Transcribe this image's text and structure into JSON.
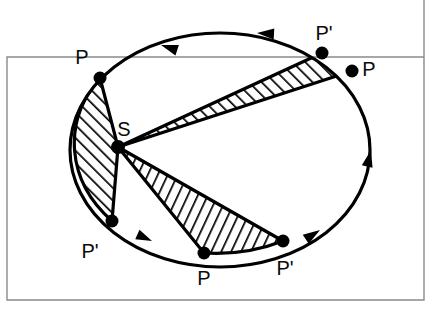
{
  "figure": {
    "kind": "keplers-second-law-diagram",
    "stroke_color": "#000000",
    "frame_color": "#8a8a8a",
    "background_color": "#ffffff",
    "hatch_color": "#000000"
  },
  "frame": {
    "left_x": 7,
    "top_y": 57,
    "right_x": 424,
    "bottom_y": 300,
    "stroke_width": 1.4
  },
  "orbit": {
    "center": {
      "x": 220,
      "y": 150
    },
    "radius_x": 150,
    "radius_y": 117,
    "stroke_width": 3.2,
    "direction": "counterclockwise"
  },
  "focus": {
    "label": "S",
    "x": 118,
    "y": 147,
    "dot_radius": 6,
    "label_x": 124,
    "label_y": 136
  },
  "orbit_points": [
    {
      "id": "p-upper-left",
      "label": "P",
      "x": 100,
      "y": 78,
      "label_x": 82,
      "label_y": 64
    },
    {
      "id": "p-prime-upper-right",
      "label": "P'",
      "x": 322,
      "y": 53,
      "label_x": 318,
      "label_y": 40
    },
    {
      "id": "p-upper-right",
      "label": "P",
      "x": 352,
      "y": 71,
      "label_x": 363,
      "label_y": 72
    },
    {
      "id": "p-prime-lower-left",
      "label": "P'",
      "x": 112,
      "y": 221,
      "label_x": 82,
      "label_y": 255
    },
    {
      "id": "p-lower-middle",
      "label": "P",
      "x": 204,
      "y": 253,
      "label_x": 197,
      "label_y": 283
    },
    {
      "id": "p-prime-lower-right",
      "label": "P'",
      "x": 283,
      "y": 241,
      "label_x": 272,
      "label_y": 273
    }
  ],
  "sectors": [
    {
      "id": "sector-left",
      "from_point": "p-upper-left",
      "to_point": "p-prime-lower-left",
      "hatch_angle_deg": 45,
      "hatch_direction": "forward-slash"
    },
    {
      "id": "sector-upper-right",
      "from_point": "p-prime-upper-right",
      "to_point": "p-upper-right",
      "hatch_angle_deg": 45,
      "hatch_direction": "forward-slash"
    },
    {
      "id": "sector-lower",
      "from_point": "p-lower-middle",
      "to_point": "p-prime-lower-right",
      "hatch_angle_deg": 65,
      "hatch_direction": "back-slash"
    }
  ],
  "direction_arrows": [
    {
      "id": "arrow-top-left",
      "x": 161,
      "y": 45,
      "rotation_deg": 198
    },
    {
      "id": "arrow-top-right",
      "x": 255,
      "y": 33,
      "rotation_deg": 183
    },
    {
      "id": "arrow-right",
      "x": 372,
      "y": 158,
      "rotation_deg": 285
    },
    {
      "id": "arrow-bottom-right",
      "x": 317,
      "y": 232,
      "rotation_deg": 329
    },
    {
      "id": "arrow-bottom-left",
      "x": 148,
      "y": 240,
      "rotation_deg": 26
    }
  ]
}
